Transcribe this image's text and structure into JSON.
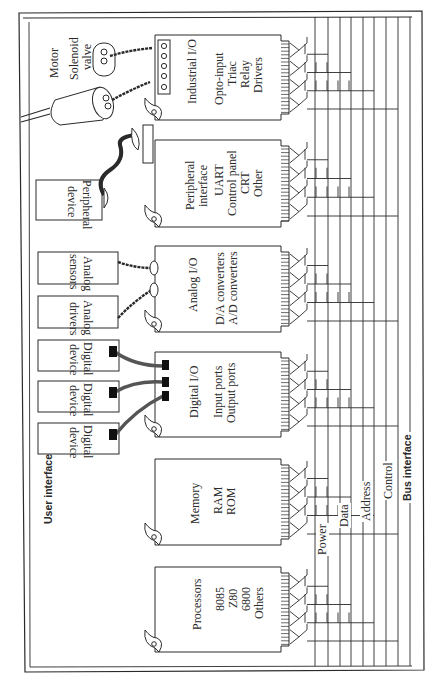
{
  "figure": {
    "frame_label": "User interface",
    "bus_label": "Bus interface",
    "bus_lines": [
      "Power",
      "Data",
      "Address",
      "Control"
    ],
    "cards": [
      {
        "id": "industrial-io",
        "title": "Industrial I/O",
        "lines": [
          "Opto-input",
          "Triac",
          "Relay",
          "Drivers"
        ]
      },
      {
        "id": "peripheral-interface",
        "title": "Peripheral interface",
        "title_lines": [
          "Peripheral",
          "interface"
        ],
        "lines": [
          "UART",
          "Control panel",
          "CRT",
          "Other"
        ]
      },
      {
        "id": "analog-io",
        "title": "Analog I/O",
        "lines": [
          "D/A converters",
          "A/D converters"
        ]
      },
      {
        "id": "digital-io",
        "title": "Digital I/O",
        "lines": [
          "Input ports",
          "Output ports"
        ]
      },
      {
        "id": "memory",
        "title": "Memory",
        "lines": [
          "RAM",
          "ROM"
        ]
      },
      {
        "id": "processors",
        "title": "Processors",
        "lines": [
          "8085",
          "Z80",
          "6800",
          "Others"
        ]
      }
    ],
    "devices": [
      {
        "id": "motor",
        "label": "Motor"
      },
      {
        "id": "solenoid-valve",
        "label_lines": [
          "Solenoid",
          "valve"
        ]
      },
      {
        "id": "peripheral-device",
        "label_lines": [
          "Peripheral",
          "device"
        ]
      },
      {
        "id": "analog-sensors",
        "label_lines": [
          "Analog",
          "sensors"
        ]
      },
      {
        "id": "analog-drivers",
        "label_lines": [
          "Analog",
          "drivers"
        ]
      },
      {
        "id": "digital-device-1",
        "label_lines": [
          "Digital",
          "device"
        ]
      },
      {
        "id": "digital-device-2",
        "label_lines": [
          "Digital",
          "device"
        ]
      },
      {
        "id": "digital-device-3",
        "label_lines": [
          "Digital",
          "device"
        ]
      }
    ],
    "colors": {
      "ink": "#2a2a2a",
      "paper": "#ffffff"
    }
  }
}
